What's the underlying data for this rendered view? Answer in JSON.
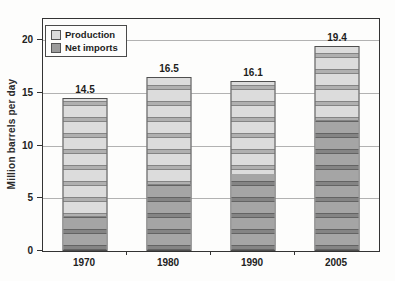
{
  "figure": {
    "ylabel": "Million barrels per day",
    "legend": [
      {
        "label": "Production",
        "color": "#dcdcdc"
      },
      {
        "label": "Net imports",
        "color": "#9b9b9b"
      }
    ],
    "colors": {
      "production_fill": "#dcdcdc",
      "net_imports_fill": "#a5a5a5",
      "bar_border": "#4f4f4f",
      "gridline": "#b2b2b2",
      "frame": "#333333"
    }
  },
  "chart_data": {
    "type": "bar",
    "stacked": true,
    "title": "",
    "xlabel": "",
    "ylabel": "Million barrels per day",
    "categories": [
      "1970",
      "1980",
      "1990",
      "2005"
    ],
    "series": [
      {
        "name": "Net imports",
        "values": [
          3.2,
          6.3,
          7.2,
          12.3
        ]
      },
      {
        "name": "Production",
        "values": [
          11.3,
          10.2,
          8.9,
          7.1
        ]
      }
    ],
    "totals": [
      14.5,
      16.5,
      16.1,
      19.4
    ],
    "total_labels": [
      "14.5",
      "16.5",
      "16.1",
      "19.4"
    ],
    "ylim": [
      0,
      22
    ],
    "yticks": [
      0,
      5,
      10,
      15,
      20
    ],
    "grid": "horizontal",
    "legend_position": "top-left"
  }
}
